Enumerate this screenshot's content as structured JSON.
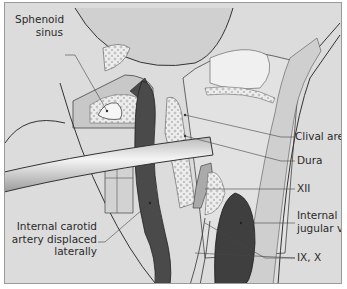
{
  "diagram": {
    "type": "anatomical-illustration",
    "style": "grayscale line drawing",
    "colors": {
      "background": "#dcdcdc",
      "border": "#9a9a9a",
      "bone_stipple": "#eeeeee",
      "artery_vein": "#4a4a4a",
      "soft_tissue": "#c8c8c8",
      "text": "#2a2a2a"
    },
    "labels": {
      "sphenoid_line1": "Sphenoid",
      "sphenoid_line2": "sinus",
      "clival_area": "Clival area",
      "dura": "Dura",
      "xii": "XII",
      "ijv_line1": "Internal",
      "ijv_line2": "jugular vein",
      "ix_x": "IX, X",
      "ica_line1": "Internal carotid",
      "ica_line2": "artery displaced",
      "ica_line3": "laterally"
    }
  }
}
